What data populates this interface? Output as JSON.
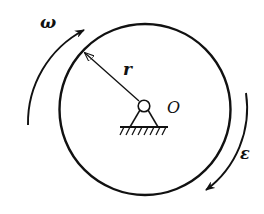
{
  "diagram": {
    "title": "",
    "labels": {
      "angular_velocity": "ω",
      "radius": "r",
      "center": "O",
      "angular_acceleration": "ε"
    },
    "elements": [
      {
        "type": "disk",
        "description": "large circular disk centered near pivot O"
      },
      {
        "type": "radius-arrow",
        "label": "r",
        "from": "center O",
        "to": "upper-left rim"
      },
      {
        "type": "pin-support",
        "label": "O",
        "description": "pinned hinge with hatched ground"
      },
      {
        "type": "curved-arrow",
        "label": "ω",
        "direction": "clockwise",
        "position": "upper-left outside disk"
      },
      {
        "type": "curved-arrow",
        "label": "ε",
        "direction": "clockwise",
        "position": "lower-right outside disk"
      }
    ],
    "colors": {
      "stroke": "#111111",
      "background": "#ffffff"
    }
  }
}
